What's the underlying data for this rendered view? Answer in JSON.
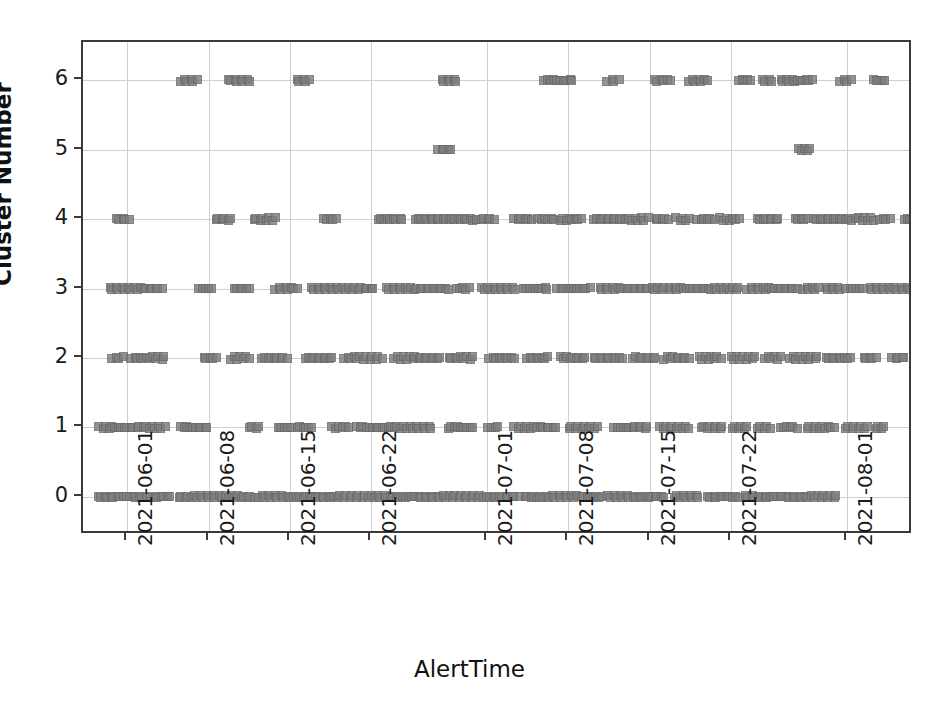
{
  "chart_data": {
    "type": "scatter",
    "title": "",
    "xlabel": "AlertTime",
    "ylabel": "Cluster Number",
    "grid": true,
    "legend": null,
    "marker": {
      "shape": "square",
      "color": "#7d7d7d",
      "edge_color": "#6a6a6a",
      "size": 9
    },
    "ylim": [
      -0.55,
      6.55
    ],
    "yticks": [
      0,
      1,
      2,
      3,
      4,
      5,
      6
    ],
    "ytick_labels": [
      "0",
      "1",
      "2",
      "3",
      "4",
      "5",
      "6"
    ],
    "xlim": [
      "2021-05-29",
      "2021-08-05"
    ],
    "xticks": [
      "2021-06-01",
      "2021-06-08",
      "2021-06-15",
      "2021-06-22",
      "2021-07-01",
      "2021-07-08",
      "2021-07-15",
      "2021-07-22",
      "2021-08-01"
    ],
    "xtick_labels": [
      "2021-06-01",
      "2021-06-08",
      "2021-06-15",
      "2021-06-22",
      "2021-07-01",
      "2021-07-08",
      "2021-07-15",
      "2021-07-22",
      "2021-08-01"
    ],
    "xtick_positions_px": [
      125,
      245,
      365,
      485,
      657,
      777,
      897,
      1017,
      1189
    ],
    "series": [
      {
        "name": "Cluster 6",
        "y": 6,
        "x_spans": [
          [
            0.118,
            0.137
          ],
          [
            0.175,
            0.201
          ],
          [
            0.257,
            0.272
          ],
          [
            0.432,
            0.45
          ],
          [
            0.555,
            0.59
          ],
          [
            0.632,
            0.645
          ],
          [
            0.688,
            0.708
          ],
          [
            0.73,
            0.752
          ],
          [
            0.79,
            0.804
          ],
          [
            0.818,
            0.83
          ],
          [
            0.84,
            0.858
          ],
          [
            0.861,
            0.878
          ],
          [
            0.912,
            0.925
          ],
          [
            0.952,
            0.966
          ]
        ]
      },
      {
        "name": "Cluster 5",
        "y": 5,
        "x_spans": [
          [
            0.428,
            0.443
          ],
          [
            0.862,
            0.876
          ]
        ]
      },
      {
        "name": "Cluster 4",
        "y": 4,
        "x_spans": [
          [
            0.04,
            0.055
          ],
          [
            0.16,
            0.178
          ],
          [
            0.205,
            0.232
          ],
          [
            0.29,
            0.305
          ],
          [
            0.355,
            0.385
          ],
          [
            0.4,
            0.47
          ],
          [
            0.475,
            0.495
          ],
          [
            0.52,
            0.54
          ],
          [
            0.548,
            0.568
          ],
          [
            0.575,
            0.6
          ],
          [
            0.615,
            0.68
          ],
          [
            0.69,
            0.705
          ],
          [
            0.715,
            0.73
          ],
          [
            0.74,
            0.76
          ],
          [
            0.768,
            0.79
          ],
          [
            0.812,
            0.838
          ],
          [
            0.858,
            0.872
          ],
          [
            0.88,
            0.93
          ],
          [
            0.935,
            0.952
          ],
          [
            0.96,
            0.972
          ],
          [
            0.99,
            1.0
          ]
        ]
      },
      {
        "name": "Cluster 3",
        "y": 3,
        "x_spans": [
          [
            0.032,
            0.095
          ],
          [
            0.14,
            0.155
          ],
          [
            0.182,
            0.2
          ],
          [
            0.232,
            0.258
          ],
          [
            0.275,
            0.35
          ],
          [
            0.365,
            0.44
          ],
          [
            0.45,
            0.465
          ],
          [
            0.48,
            0.52
          ],
          [
            0.53,
            0.56
          ],
          [
            0.572,
            0.61
          ],
          [
            0.622,
            0.7
          ],
          [
            0.705,
            0.79
          ],
          [
            0.8,
            0.86
          ],
          [
            0.868,
            0.885
          ],
          [
            0.895,
            0.912
          ],
          [
            0.92,
            0.94
          ],
          [
            0.948,
            0.98
          ],
          [
            0.985,
            1.0
          ]
        ]
      },
      {
        "name": "Cluster 2",
        "y": 2,
        "x_spans": [
          [
            0.035,
            0.048
          ],
          [
            0.058,
            0.098
          ],
          [
            0.145,
            0.16
          ],
          [
            0.178,
            0.2
          ],
          [
            0.215,
            0.245
          ],
          [
            0.268,
            0.3
          ],
          [
            0.315,
            0.36
          ],
          [
            0.375,
            0.43
          ],
          [
            0.44,
            0.47
          ],
          [
            0.49,
            0.52
          ],
          [
            0.535,
            0.56
          ],
          [
            0.575,
            0.605
          ],
          [
            0.615,
            0.65
          ],
          [
            0.662,
            0.69
          ],
          [
            0.7,
            0.73
          ],
          [
            0.742,
            0.768
          ],
          [
            0.78,
            0.81
          ],
          [
            0.822,
            0.84
          ],
          [
            0.852,
            0.885
          ],
          [
            0.895,
            0.925
          ],
          [
            0.94,
            0.955
          ],
          [
            0.975,
            0.99
          ]
        ]
      },
      {
        "name": "Cluster 1",
        "y": 1,
        "x_spans": [
          [
            0.02,
            0.098
          ],
          [
            0.118,
            0.15
          ],
          [
            0.2,
            0.212
          ],
          [
            0.235,
            0.25
          ],
          [
            0.258,
            0.275
          ],
          [
            0.3,
            0.32
          ],
          [
            0.33,
            0.42
          ],
          [
            0.44,
            0.47
          ],
          [
            0.488,
            0.5
          ],
          [
            0.52,
            0.57
          ],
          [
            0.585,
            0.62
          ],
          [
            0.64,
            0.68
          ],
          [
            0.695,
            0.73
          ],
          [
            0.745,
            0.77
          ],
          [
            0.782,
            0.8
          ],
          [
            0.812,
            0.828
          ],
          [
            0.84,
            0.86
          ],
          [
            0.872,
            0.905
          ],
          [
            0.918,
            0.945
          ],
          [
            0.955,
            0.965
          ]
        ]
      },
      {
        "name": "Cluster 0",
        "y": 0,
        "x_spans": [
          [
            0.018,
            0.075
          ],
          [
            0.082,
            0.105
          ],
          [
            0.115,
            0.205
          ],
          [
            0.212,
            0.52
          ],
          [
            0.528,
            0.595
          ],
          [
            0.6,
            0.625
          ],
          [
            0.632,
            0.7
          ],
          [
            0.712,
            0.742
          ],
          [
            0.752,
            0.79
          ],
          [
            0.798,
            0.908
          ]
        ]
      }
    ]
  }
}
